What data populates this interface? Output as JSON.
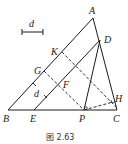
{
  "figure": {
    "caption": "图 2.63",
    "scale_bar_label": "d",
    "distance_label": "d"
  },
  "points": {
    "A": {
      "label": "A",
      "x": 93,
      "y": 18
    },
    "B": {
      "label": "B",
      "x": 8,
      "y": 110
    },
    "C": {
      "label": "C",
      "x": 117,
      "y": 110
    },
    "D": {
      "label": "D",
      "x": 100,
      "y": 40
    },
    "E": {
      "label": "E",
      "x": 34,
      "y": 110
    },
    "P": {
      "label": "P",
      "x": 84,
      "y": 110
    },
    "H": {
      "label": "H",
      "x": 113,
      "y": 102
    },
    "K": {
      "label": "K",
      "x": 62,
      "y": 52
    },
    "G": {
      "label": "G",
      "x": 44,
      "y": 71
    },
    "F": {
      "label": "F",
      "x": 57,
      "y": 84
    }
  },
  "colors": {
    "line": "#1a1a1a",
    "background": "#ffffff"
  }
}
